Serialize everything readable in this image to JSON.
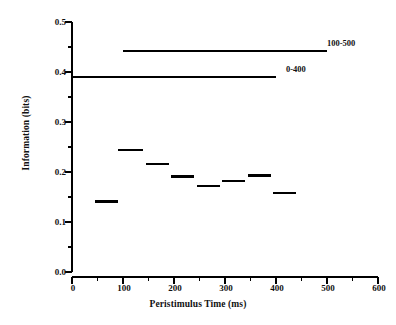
{
  "chart_data": {
    "type": "line",
    "title": "",
    "xlabel": "Peristimulus Time (ms)",
    "ylabel": "Information (bits)",
    "xlim": [
      0,
      600
    ],
    "ylim": [
      0.0,
      0.5
    ],
    "xticks": [
      0,
      100,
      200,
      300,
      400,
      500,
      600
    ],
    "xticklabels": [
      "0",
      "100",
      "200",
      "300",
      "400",
      "500",
      "600"
    ],
    "xminor_step": 50,
    "yticks": [
      0.0,
      0.1,
      0.2,
      0.3,
      0.4,
      0.5
    ],
    "yticklabels": [
      "0.0",
      "0.1",
      "0.2",
      "0.3",
      "0.4",
      "0.5"
    ],
    "yminor_step": 0.05,
    "grid": false,
    "legend_position": "inline-right",
    "series": [
      {
        "name": "windowed-information-steps",
        "type": "step-segments",
        "segments": [
          {
            "x0": 45,
            "x1": 90,
            "y": 0.141
          },
          {
            "x0": 90,
            "x1": 140,
            "y": 0.244
          },
          {
            "x0": 145,
            "x1": 190,
            "y": 0.216
          },
          {
            "x0": 195,
            "x1": 240,
            "y": 0.191
          },
          {
            "x0": 245,
            "x1": 290,
            "y": 0.172
          },
          {
            "x0": 295,
            "x1": 340,
            "y": 0.182
          },
          {
            "x0": 345,
            "x1": 390,
            "y": 0.193
          },
          {
            "x0": 395,
            "x1": 440,
            "y": 0.158
          }
        ]
      },
      {
        "name": "100-500",
        "type": "reference-line",
        "x0": 100,
        "x1": 500,
        "y": 0.442,
        "label": "100-500"
      },
      {
        "name": "0-400",
        "type": "reference-line",
        "x0": 0,
        "x1": 400,
        "y": 0.39,
        "label": "0-400"
      }
    ]
  },
  "colors": {
    "line": "#000000",
    "axis": "#000000",
    "background": "#ffffff"
  }
}
